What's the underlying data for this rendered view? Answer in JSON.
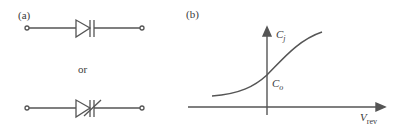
{
  "panel_a": {
    "label": "(a)",
    "connector_text": "or",
    "symbols": [
      {
        "name": "varactor-diode-symbol",
        "variant": "fixed-capacitor"
      },
      {
        "name": "varactor-diode-symbol",
        "variant": "variable-capacitor"
      }
    ]
  },
  "panel_b": {
    "label": "(b)",
    "y_axis_label": "C",
    "y_axis_sub": "j",
    "curve_point_label": "C",
    "curve_point_sub": "o",
    "x_axis_label": "V",
    "x_axis_sub": "rev"
  },
  "colors": {
    "stroke": "#555555",
    "text": "#3a3a3a",
    "background": "#ffffff"
  }
}
